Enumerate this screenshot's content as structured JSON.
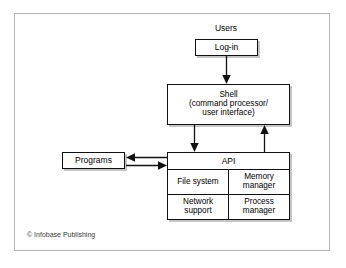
{
  "figure": {
    "credit": "© Infobase Publishing",
    "frame_border_color": "#b9b9b9",
    "background_color": "#ffffff",
    "line_color": "#111111",
    "text_color": "#000000"
  },
  "nodes": {
    "users_label": "Users",
    "login": "Log-in",
    "shell": {
      "line1": "Shell",
      "line2": "(command processor/",
      "line3": "user interface)"
    },
    "programs": "Programs",
    "api": {
      "header": "API",
      "cells": [
        {
          "line1": "File system",
          "line2": ""
        },
        {
          "line1": "Memory",
          "line2": "manager"
        },
        {
          "line1": "Network",
          "line2": "support"
        },
        {
          "line1": "Process",
          "line2": "manager"
        }
      ]
    }
  },
  "arrows": [
    {
      "name": "login-to-shell",
      "direction": "down"
    },
    {
      "name": "shell-to-api",
      "direction": "down"
    },
    {
      "name": "api-to-shell",
      "direction": "up"
    },
    {
      "name": "api-to-programs",
      "direction": "left"
    },
    {
      "name": "programs-to-api",
      "direction": "right"
    }
  ]
}
